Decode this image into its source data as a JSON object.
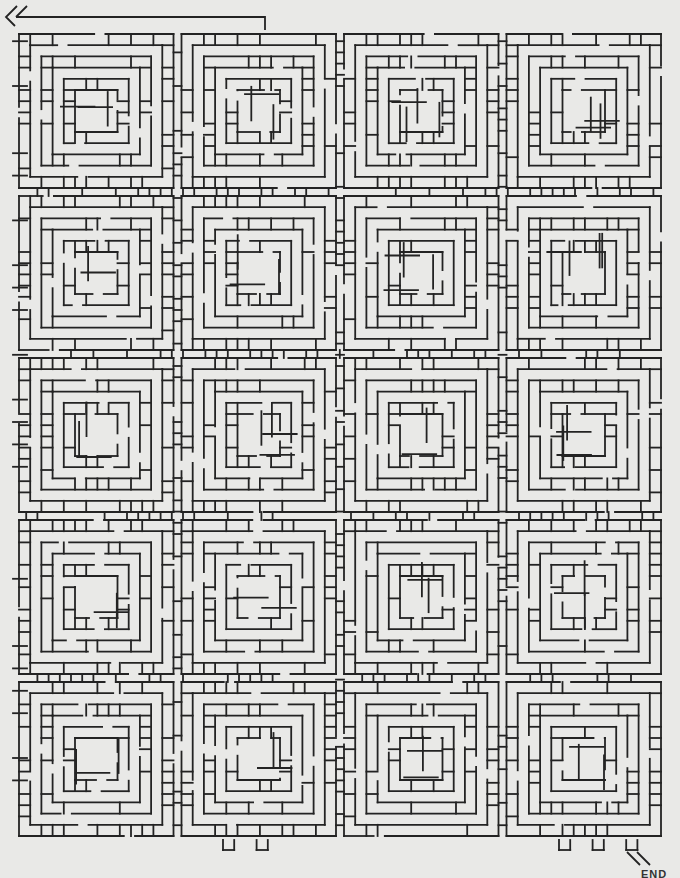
{
  "puzzle": {
    "type": "maze",
    "style": "nested square spiral blocks with ladder rungs",
    "start_marker": "double-chevron-left",
    "end_marker": "double-slash-down-right",
    "end_label": "END",
    "grid": {
      "block_columns": 4,
      "block_rows": 5,
      "rings_per_block": 5
    },
    "colors": {
      "background": "#e9e9e7",
      "ink": "#232323"
    },
    "seed": 7
  }
}
